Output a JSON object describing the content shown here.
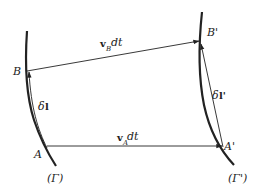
{
  "diagram": {
    "points": {
      "A": "A",
      "B": "B",
      "A_prime": "A'",
      "B_prime": "B'"
    },
    "curves": {
      "gamma": "(Γ)",
      "gamma_prime": "(Γ')"
    },
    "vectors": {
      "vB_dt": {
        "bold": "v",
        "subscript": "B",
        "suffix": " dt"
      },
      "vA_dt": {
        "bold": "v",
        "subscript": "A",
        "suffix": " dt"
      },
      "delta_l": {
        "prefix": "δ",
        "bold": "l"
      },
      "delta_l_prime": {
        "prefix": "δ",
        "bold": "l'"
      }
    },
    "colors": {
      "line": "#222222",
      "background": "#ffffff"
    }
  }
}
